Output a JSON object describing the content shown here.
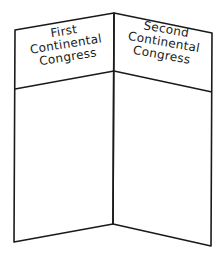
{
  "foldable": {
    "panels": [
      {
        "title_lines": [
          "First",
          "Continental",
          "Congress"
        ]
      },
      {
        "title_lines": [
          "Second",
          "Continental",
          "Congress"
        ]
      }
    ]
  },
  "colors": {
    "stroke": "#1a1a1a",
    "background": "#ffffff"
  }
}
